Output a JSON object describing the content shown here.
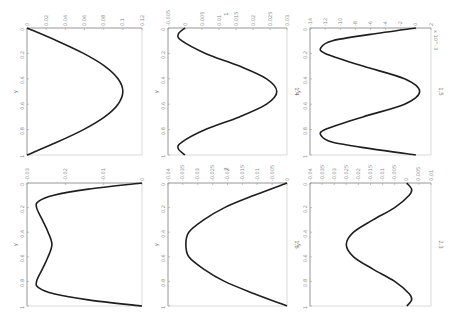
{
  "figure": {
    "orientation": "rotated 90 degrees clockwise",
    "background": "#ffffff",
    "curve_color": "#1e1e1e"
  },
  "chart_data": [
    {
      "type": "line",
      "panel": "top-left",
      "title": "",
      "xlabel": "y",
      "ylabel": "",
      "x_ticks": [
        "0",
        "0.2",
        "0.4",
        "0.6",
        "0.8",
        "1"
      ],
      "y_ticks": [
        "0",
        "0.02",
        "0.04",
        "0.06",
        "0.08",
        "0.1",
        "0.12"
      ],
      "xlim": [
        0,
        1
      ],
      "ylim": [
        0,
        0.12
      ],
      "x": [
        0,
        0.1,
        0.2,
        0.3,
        0.4,
        0.5,
        0.6,
        0.7,
        0.8,
        0.9,
        1
      ],
      "values": [
        0,
        0.031,
        0.059,
        0.081,
        0.095,
        0.1,
        0.095,
        0.081,
        0.059,
        0.031,
        0
      ]
    },
    {
      "type": "line",
      "panel": "top-middle",
      "title": "1.4",
      "xlabel": "y",
      "ylabel": "1",
      "x_ticks": [
        "0",
        "0.2",
        "0.4",
        "0.6",
        "0.8",
        "1"
      ],
      "y_ticks": [
        "-0.005",
        "0",
        "0.005",
        "0.01",
        "0.015",
        "0.02",
        "0.025",
        "0.03"
      ],
      "xlim": [
        0,
        1
      ],
      "ylim": [
        -0.005,
        0.03
      ],
      "x": [
        0,
        0.05,
        0.1,
        0.2,
        0.3,
        0.4,
        0.5,
        0.6,
        0.7,
        0.8,
        0.9,
        0.95,
        1
      ],
      "values": [
        0,
        -0.002,
        -0.001,
        0.006,
        0.016,
        0.024,
        0.027,
        0.024,
        0.016,
        0.006,
        -0.001,
        -0.002,
        0
      ]
    },
    {
      "type": "line",
      "panel": "top-right",
      "title": "1.5",
      "xlabel": "y",
      "ylabel": "",
      "y_scale_label": "x 10^-3",
      "x_ticks": [
        "0",
        "0.2",
        "0.4",
        "0.6",
        "0.8",
        "1"
      ],
      "y_ticks": [
        "-14",
        "-12",
        "-10",
        "-8",
        "-6",
        "-4",
        "-2",
        "0",
        "2"
      ],
      "xlim": [
        0,
        1
      ],
      "ylim": [
        -14,
        2
      ],
      "x": [
        0,
        0.05,
        0.1,
        0.15,
        0.2,
        0.3,
        0.4,
        0.5,
        0.6,
        0.7,
        0.8,
        0.85,
        0.9,
        0.95,
        1
      ],
      "values": [
        0,
        -6,
        -11,
        -12.5,
        -12,
        -7,
        -1.5,
        0.5,
        -1.5,
        -7,
        -12,
        -12.5,
        -11,
        -6,
        0
      ]
    },
    {
      "type": "line",
      "panel": "bottom-left",
      "title": "",
      "xlabel": "y",
      "ylabel": "",
      "x_ticks": [
        "0",
        "0.2",
        "0.4",
        "0.6",
        "0.8",
        "1"
      ],
      "y_ticks": [
        "-0.03",
        "-0.02",
        "-0.01",
        "0"
      ],
      "xlim": [
        0,
        1
      ],
      "ylim": [
        -0.03,
        0
      ],
      "x": [
        0,
        0.05,
        0.1,
        0.15,
        0.2,
        0.3,
        0.4,
        0.5,
        0.6,
        0.7,
        0.8,
        0.85,
        0.9,
        0.95,
        1
      ],
      "values": [
        0,
        -0.014,
        -0.023,
        -0.027,
        -0.0275,
        -0.026,
        -0.0245,
        -0.0235,
        -0.0245,
        -0.026,
        -0.0275,
        -0.027,
        -0.023,
        -0.014,
        0
      ]
    },
    {
      "type": "line",
      "panel": "bottom-middle",
      "title": "1.6",
      "xlabel": "y",
      "ylabel": "2",
      "x_ticks": [
        "0",
        "0.2",
        "0.4",
        "0.6",
        "0.8",
        "1"
      ],
      "y_ticks": [
        "-0.04",
        "-0.035",
        "-0.03",
        "-0.025",
        "-0.02",
        "-0.015",
        "-0.01",
        "-0.005",
        "0"
      ],
      "xlim": [
        0,
        1
      ],
      "ylim": [
        -0.04,
        0
      ],
      "x": [
        0,
        0.1,
        0.2,
        0.3,
        0.4,
        0.5,
        0.6,
        0.7,
        0.8,
        0.9,
        1
      ],
      "values": [
        0,
        -0.011,
        -0.021,
        -0.028,
        -0.033,
        -0.034,
        -0.033,
        -0.028,
        -0.021,
        -0.011,
        0
      ]
    },
    {
      "type": "line",
      "panel": "bottom-right",
      "title": "2.3",
      "xlabel": "y",
      "ylabel": "",
      "x_ticks": [
        "0",
        "0.2",
        "0.4",
        "0.6",
        "0.8",
        "1"
      ],
      "y_ticks": [
        "-0.04",
        "-0.035",
        "-0.03",
        "-0.025",
        "-0.02",
        "-0.015",
        "-0.01",
        "-0.005",
        "0",
        "0.005",
        "0.01"
      ],
      "xlim": [
        0,
        1
      ],
      "ylim": [
        -0.04,
        0.01
      ],
      "x": [
        0,
        0.05,
        0.1,
        0.2,
        0.3,
        0.4,
        0.5,
        0.6,
        0.7,
        0.8,
        0.9,
        0.95,
        1
      ],
      "values": [
        0,
        0.002,
        0.001,
        -0.005,
        -0.014,
        -0.022,
        -0.025,
        -0.022,
        -0.014,
        -0.005,
        0.001,
        0.002,
        0
      ]
    }
  ],
  "panels": [
    {
      "title": "",
      "xlabel": "y",
      "ylabel": ""
    },
    {
      "title": "1.4",
      "xlabel": "y",
      "ylabel": "1"
    },
    {
      "title": "1.5",
      "xlabel": "y",
      "ylabel": "",
      "scale": "x 10^-3"
    },
    {
      "title": "",
      "xlabel": "y",
      "ylabel": ""
    },
    {
      "title": "1.6",
      "xlabel": "y",
      "ylabel": "2"
    },
    {
      "title": "2.3",
      "xlabel": "y",
      "ylabel": ""
    }
  ]
}
